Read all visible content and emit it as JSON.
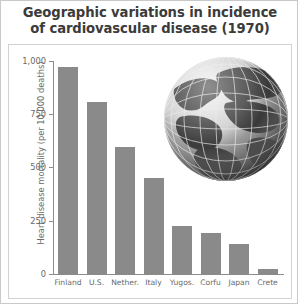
{
  "chart_data": {
    "type": "bar",
    "title": "Geographic variations in incidence of cardiovascular disease (1970)",
    "title_lines": [
      "Geographic variations in incidence",
      "of cardiovascular disease (1970)"
    ],
    "xlabel": "",
    "ylabel": "Heart disease mortality (per 10,000 deaths)",
    "categories": [
      "Finland",
      "U.S.",
      "Nether.",
      "Italy",
      "Yugos.",
      "Corfu",
      "Japan",
      "Crete"
    ],
    "values": [
      975,
      810,
      600,
      455,
      230,
      195,
      145,
      30
    ],
    "ylim": [
      0,
      1000
    ],
    "yticks": [
      0,
      250,
      500,
      750,
      1000
    ],
    "ytick_labels": [
      "0",
      "250",
      "500",
      "750",
      "1,000"
    ],
    "grid": false,
    "legend": null,
    "bar_color": "#8a8a8a",
    "axis_color": "#8c8c8c",
    "text_color": "#6a6a6a",
    "title_color": "#3b3b3b",
    "annotations": [
      "decorative grayscale globe illustration in upper right of plot area"
    ]
  },
  "figure": {
    "background": "#ffffff",
    "border_color": "#c9c9c9"
  },
  "globe": {
    "name": "globe-illustration",
    "description": "grayscale Earth globe with latitude and longitude grid lines"
  }
}
